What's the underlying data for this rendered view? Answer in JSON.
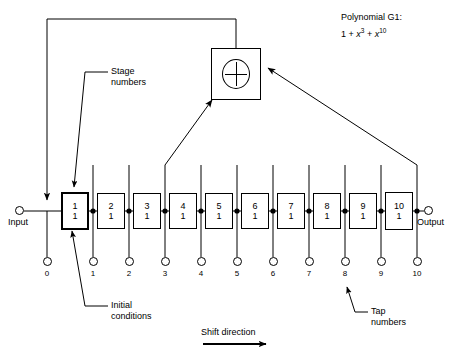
{
  "diagram": {
    "title_polynomial_label": "Polynomial G1:",
    "polynomial_expression": "1 + x3 + x10",
    "polynomial_parts": {
      "term1": "1",
      "plus1": "+",
      "var2": "x",
      "exp2": "3",
      "plus2": "+",
      "var3": "x",
      "exp3": "10"
    },
    "input_label": "Input",
    "output_label": "Output",
    "shift_direction_label": "Shift direction",
    "adder_symbol": "xor-plus",
    "callouts": {
      "stage_numbers_line1": "Stage",
      "stage_numbers_line2": "numbers",
      "initial_conditions_line1": "Initial",
      "initial_conditions_line2": "conditions",
      "tap_numbers_line1": "Tap",
      "tap_numbers_line2": "numbers"
    },
    "stages": [
      {
        "number": "1",
        "initial_condition": "1"
      },
      {
        "number": "2",
        "initial_condition": "1"
      },
      {
        "number": "3",
        "initial_condition": "1"
      },
      {
        "number": "4",
        "initial_condition": "1"
      },
      {
        "number": "5",
        "initial_condition": "1"
      },
      {
        "number": "6",
        "initial_condition": "1"
      },
      {
        "number": "7",
        "initial_condition": "1"
      },
      {
        "number": "8",
        "initial_condition": "1"
      },
      {
        "number": "9",
        "initial_condition": "1"
      },
      {
        "number": "10",
        "initial_condition": "1"
      }
    ],
    "taps": [
      {
        "label": "0"
      },
      {
        "label": "1"
      },
      {
        "label": "2"
      },
      {
        "label": "3"
      },
      {
        "label": "4"
      },
      {
        "label": "5"
      },
      {
        "label": "6"
      },
      {
        "label": "7"
      },
      {
        "label": "8"
      },
      {
        "label": "9"
      },
      {
        "label": "10"
      }
    ],
    "feedback_taps": [
      "3",
      "10"
    ],
    "colors": {
      "line": "#000000",
      "background": "#ffffff",
      "text": "#000000"
    }
  }
}
